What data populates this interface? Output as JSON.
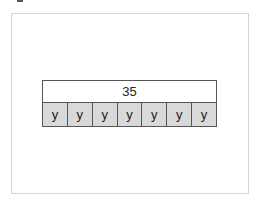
{
  "diagram": {
    "total_label": "35",
    "parts": [
      {
        "label": "y"
      },
      {
        "label": "y"
      },
      {
        "label": "y"
      },
      {
        "label": "y"
      },
      {
        "label": "y"
      },
      {
        "label": "y"
      },
      {
        "label": "y"
      }
    ]
  },
  "colors": {
    "part_fill": "#d9d9d9",
    "total_fill": "#ffffff",
    "border": "#555555",
    "frame_border": "#d4d4d4"
  }
}
